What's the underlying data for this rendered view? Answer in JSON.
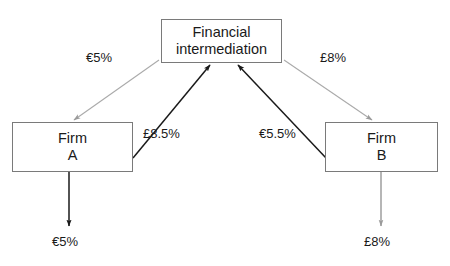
{
  "diagram": {
    "background_color": "#ffffff",
    "nodes": {
      "intermediary": {
        "line1": "Financial",
        "line2": "intermediation"
      },
      "firm_a": {
        "line1": "Firm",
        "line2": "A"
      },
      "firm_b": {
        "line1": "Firm",
        "line2": "B"
      }
    },
    "edge_labels": {
      "euro_top_left": "€5%",
      "pound_top_right": "£8%",
      "pound_mid_left": "£8.5%",
      "euro_mid_right": "€5.5%",
      "euro_bottom": "€5%",
      "pound_bottom": "£8%"
    },
    "colors": {
      "dark_edge": "#1a1a1a",
      "light_edge": "#aaaaaa",
      "box_border": "#7a7a7a",
      "text": "#1a1a1a"
    }
  }
}
